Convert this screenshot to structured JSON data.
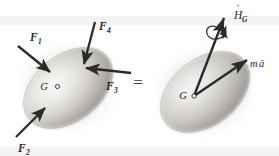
{
  "figure": {
    "equals_sign": "=",
    "background_color": "#ffffff",
    "ink_color": "#2b2b2b",
    "body_fill_light": "#f2f0ee",
    "body_fill_mid": "#c9c6c2",
    "body_fill_dark": "#8e8b88",
    "shadow_color": "#b9b6b2"
  },
  "left_body": {
    "name": "free-body-diagram",
    "center_label": "G",
    "center_marker": "○",
    "forces": [
      {
        "id": "F1",
        "label": "F",
        "subscript": "1",
        "description": "force applied upper-left pointing into body"
      },
      {
        "id": "F2",
        "label": "F",
        "subscript": "2",
        "description": "force applied lower-left pointing up-right into body"
      },
      {
        "id": "F3",
        "label": "F",
        "subscript": "3",
        "description": "force applied right side pointing left into body"
      },
      {
        "id": "F4",
        "label": "F",
        "subscript": "4",
        "description": "force applied top pointing down into body"
      }
    ]
  },
  "right_body": {
    "name": "kinetic-diagram",
    "center_label": "G",
    "center_marker": "○",
    "vectors": [
      {
        "id": "HGdot",
        "label": "H",
        "accent": "̇",
        "subscript": "G",
        "description": "rate of change of angular momentum about G, double arrowhead with spin arrow",
        "arrowhead": "double",
        "has_spin_arrow": true
      },
      {
        "id": "ma",
        "label": "m",
        "vector_symbol": "ā",
        "description": "mass times acceleration of mass center",
        "arrowhead": "single",
        "has_spin_arrow": false
      }
    ]
  }
}
